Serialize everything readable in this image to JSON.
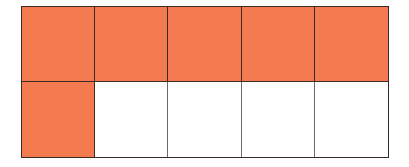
{
  "diagram": {
    "type": "fraction-grid",
    "rows": 2,
    "columns": 5,
    "total_cells": 10,
    "filled_cells": 6,
    "fill_color": "#f47a4f",
    "empty_color": "#ffffff",
    "line_color": "#3a2a25",
    "cells": [
      {
        "row": 1,
        "col": 1,
        "filled": true
      },
      {
        "row": 1,
        "col": 2,
        "filled": true
      },
      {
        "row": 1,
        "col": 3,
        "filled": true
      },
      {
        "row": 1,
        "col": 4,
        "filled": true
      },
      {
        "row": 1,
        "col": 5,
        "filled": true
      },
      {
        "row": 2,
        "col": 1,
        "filled": true
      },
      {
        "row": 2,
        "col": 2,
        "filled": false
      },
      {
        "row": 2,
        "col": 3,
        "filled": false
      },
      {
        "row": 2,
        "col": 4,
        "filled": false
      },
      {
        "row": 2,
        "col": 5,
        "filled": false
      }
    ]
  }
}
